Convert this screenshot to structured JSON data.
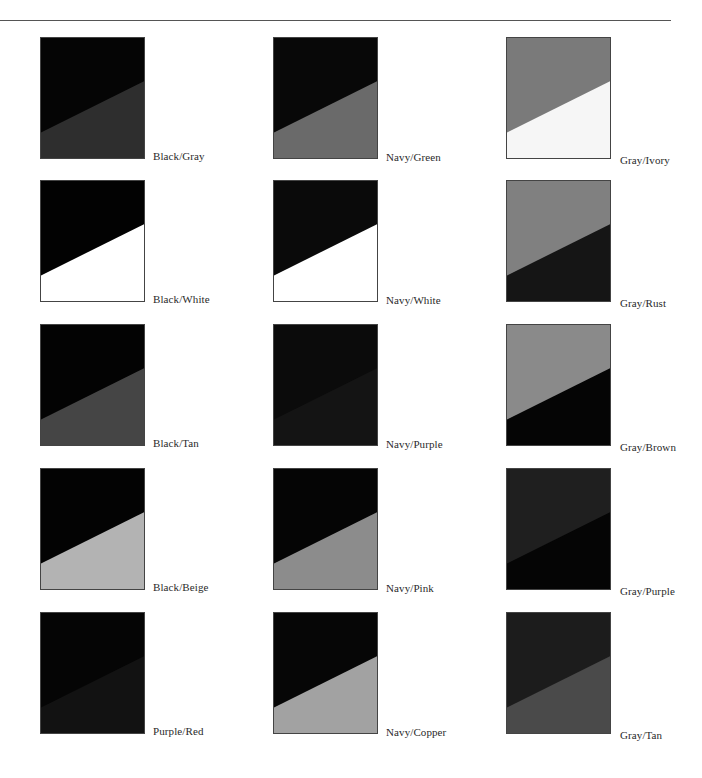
{
  "page": {
    "rule": true
  },
  "swatches": [
    {
      "label": "Black/Gray",
      "top_color": "#050505",
      "bottom_color": "#2e2e2e",
      "col": 0,
      "row": 0
    },
    {
      "label": "Navy/Green",
      "top_color": "#080808",
      "bottom_color": "#6a6a6a",
      "col": 1,
      "row": 0
    },
    {
      "label": "Gray/Ivory",
      "top_color": "#7a7a7a",
      "bottom_color": "#f6f6f6",
      "col": 2,
      "row": 0
    },
    {
      "label": "Black/White",
      "top_color": "#020202",
      "bottom_color": "#ffffff",
      "col": 0,
      "row": 1
    },
    {
      "label": "Navy/White",
      "top_color": "#0a0a0a",
      "bottom_color": "#ffffff",
      "col": 1,
      "row": 1
    },
    {
      "label": "Gray/Rust",
      "top_color": "#808080",
      "bottom_color": "#151515",
      "col": 2,
      "row": 1
    },
    {
      "label": "Black/Tan",
      "top_color": "#030303",
      "bottom_color": "#454545",
      "col": 0,
      "row": 2
    },
    {
      "label": "Navy/Purple",
      "top_color": "#0b0b0b",
      "bottom_color": "#141414",
      "col": 1,
      "row": 2
    },
    {
      "label": "Gray/Brown",
      "top_color": "#8a8a8a",
      "bottom_color": "#050505",
      "col": 2,
      "row": 2
    },
    {
      "label": "Black/Beige",
      "top_color": "#030303",
      "bottom_color": "#b3b3b3",
      "col": 0,
      "row": 3
    },
    {
      "label": "Navy/Pink",
      "top_color": "#050505",
      "bottom_color": "#8c8c8c",
      "col": 1,
      "row": 3
    },
    {
      "label": "Gray/Purple",
      "top_color": "#1f1f1f",
      "bottom_color": "#050505",
      "col": 2,
      "row": 3
    },
    {
      "label": "Purple/Red",
      "top_color": "#050505",
      "bottom_color": "#121212",
      "col": 0,
      "row": 4
    },
    {
      "label": "Navy/Copper",
      "top_color": "#060606",
      "bottom_color": "#a2a2a2",
      "col": 1,
      "row": 4
    },
    {
      "label": "Gray/Tan",
      "top_color": "#1c1c1c",
      "bottom_color": "#4a4a4a",
      "col": 2,
      "row": 4
    }
  ],
  "layout": {
    "col_x": [
      40,
      273,
      506
    ],
    "row_y": [
      37,
      180,
      324,
      468,
      612
    ],
    "label_x": [
      153,
      386,
      620
    ],
    "label_dy": [
      113,
      114,
      117
    ]
  }
}
